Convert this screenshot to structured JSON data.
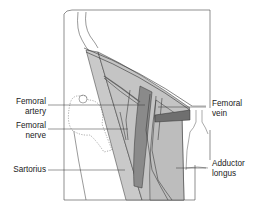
{
  "diagram": {
    "colors": {
      "background": "#ffffff",
      "outline": "#333333",
      "muscle_light": "#c9c9c9",
      "muscle_mid": "#b4b4b4",
      "artery_dark": "#8a8a8a",
      "vessel_band": "#6f6f6f",
      "label_text": "#222222"
    },
    "labels": {
      "femoral_artery": {
        "line1": "Femoral",
        "line2": "artery"
      },
      "femoral_nerve": {
        "line1": "Femoral",
        "line2": "nerve"
      },
      "sartorius": {
        "line1": "Sartorius"
      },
      "femoral_vein": {
        "line1": "Femoral",
        "line2": "vein"
      },
      "adductor_longus": {
        "line1": "Adductor",
        "line2": "longus"
      }
    }
  }
}
